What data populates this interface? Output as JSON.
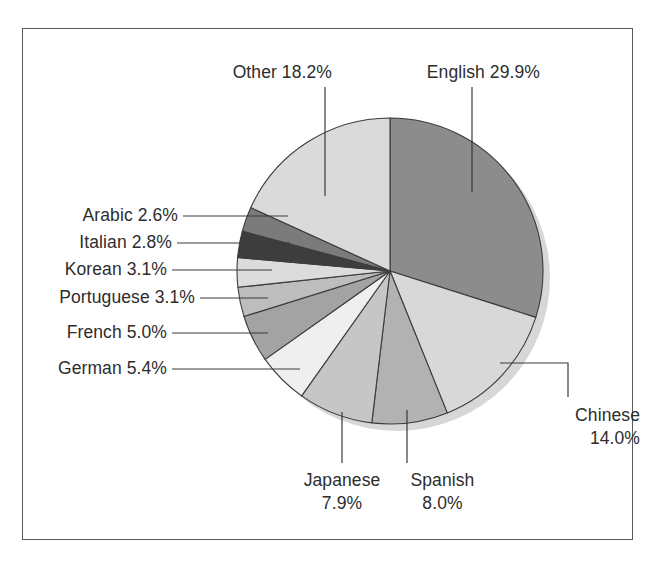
{
  "figure": {
    "background_color": "#ffffff",
    "frame_color": "#5a5a5a",
    "label_color": "#2d2d2d",
    "leader_line_color": "#3a3a3a",
    "shadow_color": "#d0d0d0"
  },
  "chart_data": {
    "type": "pie",
    "title": "",
    "subtitle": "",
    "xlabel": "",
    "ylabel": "",
    "legend_position": "none",
    "grid": false,
    "start_angle_deg": 0,
    "direction": "clockwise",
    "units": "percent",
    "total": "100.0%",
    "categories": [
      "English",
      "Chinese",
      "Spanish",
      "Japanese",
      "German",
      "French",
      "Portuguese",
      "Korean",
      "Italian",
      "Arabic",
      "Other"
    ],
    "values": [
      29.9,
      14.0,
      8.0,
      7.9,
      5.4,
      5.0,
      3.1,
      3.1,
      2.8,
      2.6,
      18.2
    ],
    "slices": [
      {
        "name": "English",
        "value": 29.9,
        "label": "English 29.9%",
        "label_name": "English",
        "label_value": "29.9%",
        "color": "#8c8c8c"
      },
      {
        "name": "Chinese",
        "value": 14.0,
        "label": "Chinese 14.0%",
        "label_name": "Chinese",
        "label_value": "14.0%",
        "color": "#d8d8d8"
      },
      {
        "name": "Spanish",
        "value": 8.0,
        "label": "Spanish 8.0%",
        "label_name": "Spanish",
        "label_value": "8.0%",
        "color": "#b2b2b2"
      },
      {
        "name": "Japanese",
        "value": 7.9,
        "label": "Japanese 7.9%",
        "label_name": "Japanese",
        "label_value": "7.9%",
        "color": "#c6c6c6"
      },
      {
        "name": "German",
        "value": 5.4,
        "label": "German 5.4%",
        "label_name": "German",
        "label_value": "5.4%",
        "color": "#efefef"
      },
      {
        "name": "French",
        "value": 5.0,
        "label": "French 5.0%",
        "label_name": "French",
        "label_value": "5.0%",
        "color": "#a3a3a3"
      },
      {
        "name": "Portuguese",
        "value": 3.1,
        "label": "Portuguese 3.1%",
        "label_name": "Portuguese",
        "label_value": "3.1%",
        "color": "#bdbdbd"
      },
      {
        "name": "Korean",
        "value": 3.1,
        "label": "Korean 3.1%",
        "label_name": "Korean",
        "label_value": "3.1%",
        "color": "#dcdcdc"
      },
      {
        "name": "Italian",
        "value": 2.8,
        "label": "Italian 2.8%",
        "label_name": "Italian",
        "label_value": "2.8%",
        "color": "#3d3d3d"
      },
      {
        "name": "Arabic",
        "value": 2.6,
        "label": "Arabic 2.6%",
        "label_name": "Arabic",
        "label_value": "2.6%",
        "color": "#7b7b7b"
      },
      {
        "name": "Other",
        "value": 18.2,
        "label": "Other 18.2%",
        "label_name": "Other",
        "label_value": "18.2%",
        "color": "#dadada"
      }
    ]
  },
  "labels": {
    "other": "Other 18.2%",
    "english": "English 29.9%",
    "arabic": "Arabic 2.6%",
    "italian": "Italian 2.8%",
    "korean": "Korean 3.1%",
    "portuguese": "Portuguese 3.1%",
    "french": "French 5.0%",
    "german": "German 5.4%",
    "chinese_name": "Chinese",
    "chinese_value": "14.0%",
    "japanese_name": "Japanese",
    "japanese_value": "7.9%",
    "spanish_name": "Spanish",
    "spanish_value": "8.0%"
  }
}
